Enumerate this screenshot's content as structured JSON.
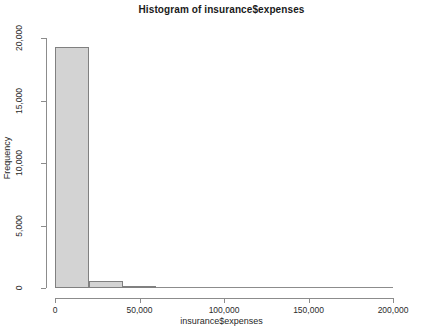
{
  "chart_data": {
    "type": "bar",
    "title": "Histogram of insurance$expenses",
    "xlabel": "insurance$expenses",
    "ylabel": "Frequency",
    "xlim": [
      0,
      213000
    ],
    "ylim": [
      0,
      20800
    ],
    "grid": false,
    "legend": "none",
    "bin_width": 20000,
    "bar_fill_color": "#d3d3d3",
    "bar_border_color": "#808080",
    "x_ticks": [
      {
        "value": 0,
        "label": "0"
      },
      {
        "value": 50000,
        "label": "50,000"
      },
      {
        "value": 100000,
        "label": "100,000"
      },
      {
        "value": 150000,
        "label": "150,000"
      },
      {
        "value": 200000,
        "label": "200,000"
      }
    ],
    "y_ticks": [
      {
        "value": 0,
        "label": "0"
      },
      {
        "value": 5000,
        "label": "5,000"
      },
      {
        "value": 10000,
        "label": "10,000"
      },
      {
        "value": 15000,
        "label": "15,000"
      },
      {
        "value": 20000,
        "label": "20,000"
      }
    ],
    "bins": [
      {
        "x0": 0,
        "x1": 20000,
        "count": 19300
      },
      {
        "x0": 20000,
        "x1": 40000,
        "count": 600
      },
      {
        "x0": 40000,
        "x1": 60000,
        "count": 100
      },
      {
        "x0": 60000,
        "x1": 80000,
        "count": 0
      },
      {
        "x0": 80000,
        "x1": 100000,
        "count": 0
      },
      {
        "x0": 100000,
        "x1": 120000,
        "count": 0
      },
      {
        "x0": 120000,
        "x1": 140000,
        "count": 0
      },
      {
        "x0": 140000,
        "x1": 160000,
        "count": 0
      },
      {
        "x0": 160000,
        "x1": 180000,
        "count": 0
      },
      {
        "x0": 180000,
        "x1": 200000,
        "count": 0
      }
    ],
    "categories": [
      "0-20,000",
      "20,000-40,000",
      "40,000-60,000",
      "60,000-80,000",
      "80,000-100,000",
      "100,000-120,000",
      "120,000-140,000",
      "140,000-160,000",
      "160,000-180,000",
      "180,000-200,000"
    ],
    "values": [
      19300,
      600,
      100,
      0,
      0,
      0,
      0,
      0,
      0,
      0
    ]
  }
}
